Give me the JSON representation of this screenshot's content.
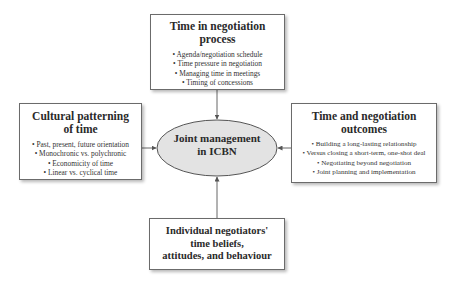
{
  "diagram": {
    "center": {
      "label_line1": "Joint management",
      "label_line2": "in ICBN",
      "fill": "#e3e3e3"
    },
    "top": {
      "title_line1": "Time in negotiation",
      "title_line2": "process",
      "items": [
        "• Agenda/negotiation schedule",
        "• Time pressure in negotiation",
        "• Managing time in meetings",
        "• Timing of concessions"
      ]
    },
    "left": {
      "title_line1": "Cultural patterning",
      "title_line2": "of time",
      "items": [
        "• Past, present, future orientation",
        "• Monochronic vs. polychronic",
        "• Economicity of time",
        "• Linear vs. cyclical time"
      ]
    },
    "right": {
      "title_line1": "Time and negotiation",
      "title_line2": "outcomes",
      "items": [
        "• Building a long-lasting relationship",
        "• Versus closing a short-term, one-shot deal",
        "• Negotiating beyond negotiation",
        "• Joint planning and implementation"
      ]
    },
    "bottom": {
      "title_line1": "Individual negotiators'",
      "title_line2": "time beliefs,",
      "title_line3": "attitudes, and behaviour"
    }
  }
}
